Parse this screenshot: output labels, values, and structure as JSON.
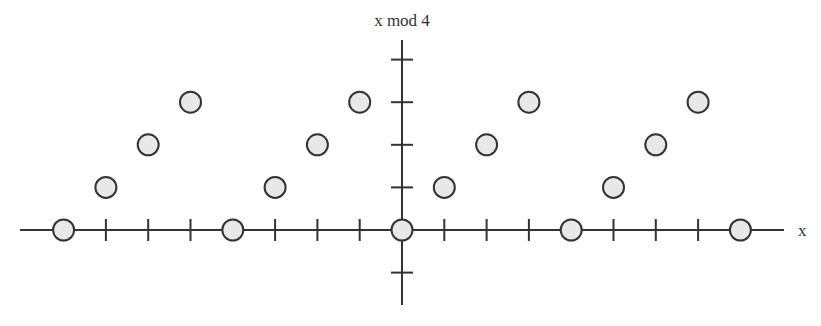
{
  "chart_data": {
    "type": "scatter",
    "title": "",
    "xlabel": "x",
    "ylabel": "x mod 4",
    "x": [
      -8,
      -7,
      -6,
      -5,
      -4,
      -3,
      -2,
      -1,
      0,
      1,
      2,
      3,
      4,
      5,
      6,
      7,
      8
    ],
    "series": [
      {
        "name": "x mod 4",
        "values": [
          0,
          1,
          2,
          3,
          0,
          1,
          2,
          3,
          0,
          1,
          2,
          3,
          0,
          1,
          2,
          3,
          0
        ]
      }
    ],
    "x_ticks": [
      -8,
      -7,
      -6,
      -5,
      -4,
      -3,
      -2,
      -1,
      0,
      1,
      2,
      3,
      4,
      5,
      6,
      7,
      8
    ],
    "y_ticks": [
      -1,
      1,
      2,
      3,
      4
    ],
    "xlim": [
      -9,
      9.3
    ],
    "ylim": [
      -1.8,
      4.3
    ],
    "grid": false,
    "legend": "none",
    "tick_labels_shown": false,
    "colors": {
      "axis": "#333333",
      "marker_fill": "#e8e8e8",
      "marker_stroke": "#333333",
      "background": "#ffffff"
    }
  }
}
